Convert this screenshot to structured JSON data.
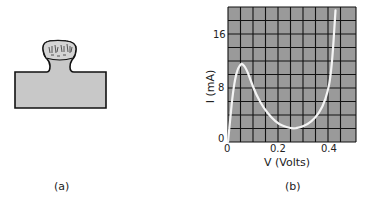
{
  "panel_a": {
    "caption": "(a)",
    "figure": "device-cross-section",
    "fill_color": "#c8c8c8",
    "outline_color": "#111111"
  },
  "panel_b": {
    "caption": "(b)",
    "y_axis_label": "I (mA)",
    "x_axis_label": "V (Volts)",
    "x_ticks": [
      "0",
      "0.2",
      "0.4"
    ],
    "y_ticks": [
      "0",
      "8",
      "16"
    ],
    "grid_bg": "#9a9a9a",
    "curve_color": "#f4f4f4"
  },
  "chart_data": {
    "type": "line",
    "title": "",
    "xlabel": "V (Volts)",
    "ylabel": "I (mA)",
    "xlim": [
      0,
      0.5
    ],
    "ylim": [
      0,
      20
    ],
    "grid": true,
    "x_ticks": [
      0,
      0.2,
      0.4
    ],
    "y_ticks": [
      0,
      8,
      16
    ],
    "series": [
      {
        "name": "I-V curve",
        "x": [
          0.0,
          0.01,
          0.02,
          0.03,
          0.04,
          0.05,
          0.055,
          0.07,
          0.09,
          0.11,
          0.14,
          0.17,
          0.2,
          0.23,
          0.25,
          0.28,
          0.31,
          0.34,
          0.37,
          0.39,
          0.4,
          0.41,
          0.42
        ],
        "values": [
          0.0,
          4.0,
          7.5,
          9.8,
          11.0,
          11.5,
          11.6,
          11.0,
          9.0,
          7.0,
          5.0,
          3.6,
          2.6,
          2.2,
          2.0,
          2.1,
          2.6,
          3.5,
          5.2,
          7.5,
          9.5,
          13.5,
          19.5
        ]
      }
    ]
  }
}
